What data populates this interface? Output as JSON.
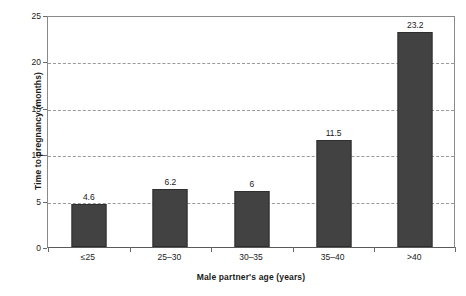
{
  "chart_data": {
    "type": "bar",
    "title": "",
    "subtitle": "",
    "xlabel": "Male partner's age (years)",
    "ylabel": "Time to pregnancy (months)",
    "categories": [
      "≤25",
      "25–30",
      "30–35",
      "35–40",
      ">40"
    ],
    "values": [
      4.6,
      6.2,
      6,
      11.5,
      23.2
    ],
    "data_labels": [
      "4.6",
      "6.2",
      "6",
      "11.5",
      "23.2"
    ],
    "ylim": [
      0,
      25
    ],
    "yticks": [
      0,
      5,
      10,
      15,
      20,
      25
    ],
    "ytick_labels": [
      "0",
      "5",
      "10",
      "15",
      "20",
      "25"
    ],
    "gridlines": [
      5,
      10,
      15,
      20
    ],
    "grid": true,
    "grid_style": "dashed",
    "legend": null,
    "legend_position": "none",
    "bar_color": "#424242",
    "bar_border_color": "#2e2e2e",
    "axis_color": "#6a6a6a",
    "grid_color": "#9a9a9a",
    "background_color": "#ffffff",
    "text_color": "#1a1a1a"
  }
}
